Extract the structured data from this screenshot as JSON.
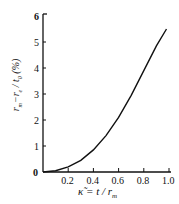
{
  "chart_data": {
    "type": "line",
    "title": "",
    "xlabel": "κ̃ = t / r_m",
    "ylabel": "(r_m − r_e) / t_0 (%)",
    "x_ticks": [
      "0.2",
      "0.4",
      "0.6",
      "0.8",
      "1.0"
    ],
    "y_ticks": [
      "0",
      "1",
      "2",
      "3",
      "4",
      "5",
      "6"
    ],
    "origin_label": "0",
    "xlim": [
      0,
      1.0
    ],
    "ylim": [
      0,
      6
    ],
    "grid": false,
    "series": [
      {
        "name": "curve",
        "x": [
          0,
          0.1,
          0.2,
          0.3,
          0.4,
          0.5,
          0.6,
          0.7,
          0.8,
          0.9,
          0.98
        ],
        "y": [
          0,
          0.05,
          0.2,
          0.45,
          0.85,
          1.4,
          2.1,
          2.95,
          3.9,
          4.85,
          5.5
        ]
      }
    ]
  },
  "labels": {
    "xlabel": "κ̃ = t / r",
    "xlabel_sub": "m",
    "ylabel_num": "r",
    "ylabel_den": "t",
    "ylabel_unit": "(%)"
  }
}
